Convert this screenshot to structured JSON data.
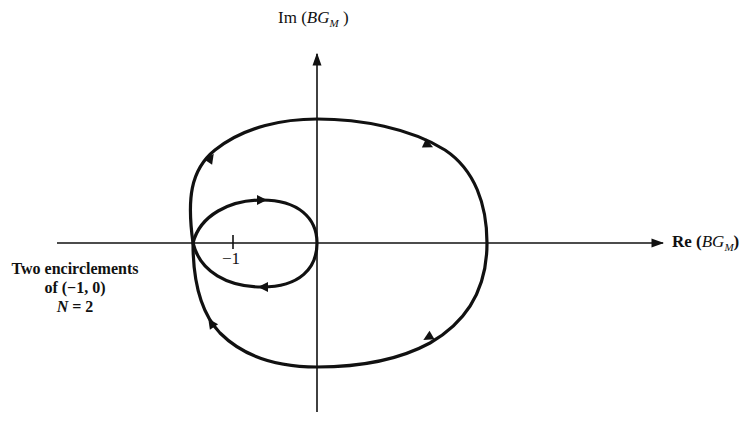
{
  "figure": {
    "type": "nyquist-plot",
    "axes": {
      "y_label_prefix": "Im (",
      "y_label_var": "BG",
      "y_label_sub": "M",
      "y_label_suffix": " )",
      "x_label_prefix": "Re (",
      "x_label_var": "BG",
      "x_label_sub": "M",
      "x_label_suffix": ")"
    },
    "tick": {
      "label": "−1",
      "value": -1
    },
    "annotation": {
      "line1": "Two encirclements",
      "line2": "of (−1, 0)",
      "line3_var": "N",
      "line3_rest": " = 2"
    },
    "curves": [
      {
        "name": "outer-contour",
        "direction": "clockwise",
        "arrows": 4
      },
      {
        "name": "inner-loop",
        "direction": "clockwise",
        "arrows": 2
      }
    ],
    "colors": {
      "ink": "#111111",
      "background": "#ffffff"
    }
  }
}
